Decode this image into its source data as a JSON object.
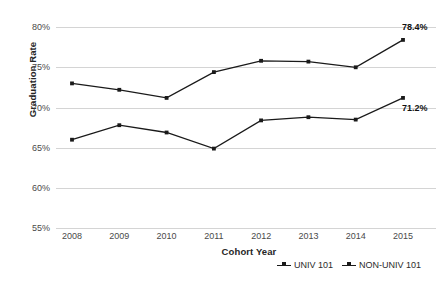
{
  "chart_data": {
    "type": "line",
    "title": "",
    "xlabel": "Cohort Year",
    "ylabel": "Graduation Rate",
    "categories": [
      "2008",
      "2009",
      "2010",
      "2011",
      "2012",
      "2013",
      "2014",
      "2015"
    ],
    "ylim": [
      55,
      80
    ],
    "yticks": [
      "55%",
      "60%",
      "65%",
      "70%",
      "75%",
      "80%"
    ],
    "ytick_values": [
      55,
      60,
      65,
      70,
      75,
      80
    ],
    "grid": "horizontal",
    "legend_position": "bottom-right",
    "series": [
      {
        "name": "UNIV 101",
        "values": [
          73.0,
          72.2,
          71.2,
          74.4,
          75.8,
          75.7,
          75.0,
          78.4
        ],
        "marker": "square",
        "color": "#1a1a1a",
        "end_label": "78.4%"
      },
      {
        "name": "NON-UNIV 101",
        "values": [
          66.0,
          67.8,
          66.9,
          64.9,
          68.4,
          68.8,
          68.5,
          71.2
        ],
        "marker": "square",
        "color": "#1a1a1a",
        "end_label": "71.2%"
      }
    ],
    "annotations": [
      {
        "text": "78.4%",
        "series": "UNIV 101",
        "category": "2015"
      },
      {
        "text": "71.2%",
        "series": "NON-UNIV 101",
        "category": "2015"
      }
    ]
  },
  "legend": {
    "items": [
      {
        "label": "UNIV 101"
      },
      {
        "label": "NON-UNIV 101"
      }
    ]
  },
  "axes": {
    "y_title": "Graduation Rate",
    "x_title": "Cohort Year"
  }
}
